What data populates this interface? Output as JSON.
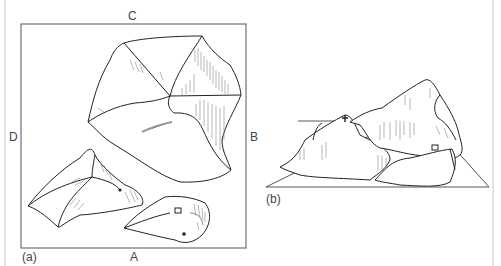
{
  "figure": {
    "panel_a": {
      "caption": "(a)",
      "side_labels": {
        "top": "C",
        "right": "B",
        "bottom": "A",
        "left": "D"
      },
      "description": "Plan view map of three hill masses with ridge lines and hachure shading",
      "markers": [
        "cross-marker",
        "building-marker",
        "dot-marker"
      ]
    },
    "panel_b": {
      "caption": "(b)",
      "description": "Perspective block view of the same terrain on a tilted plane",
      "markers": [
        "cross-marker",
        "building-marker"
      ]
    },
    "colors": {
      "line": "#222222",
      "frame": "#555555",
      "hachure": "#888888",
      "outer_frame": "#e2e2e2"
    }
  }
}
